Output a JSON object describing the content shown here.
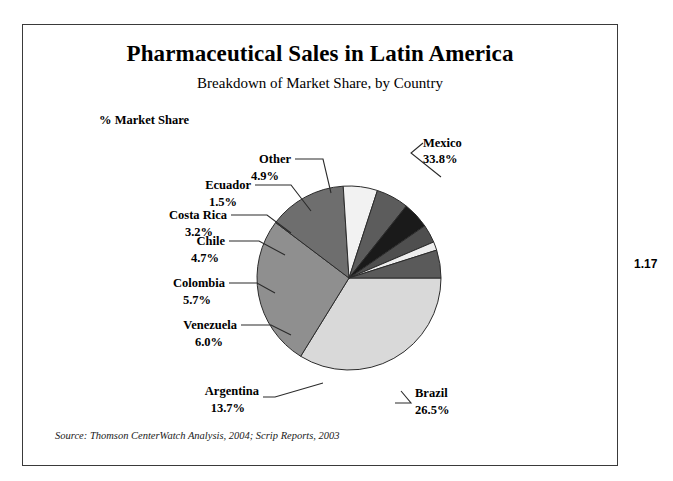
{
  "figure": {
    "number": "1.17",
    "title": "Pharmaceutical Sales in Latin America",
    "subtitle": "Breakdown of Market Share, by Country",
    "axis_note": "% Market Share",
    "source": "Source: Thomson CenterWatch Analysis, 2004; Scrip Reports, 2003"
  },
  "chart_data": {
    "type": "pie",
    "title": "Pharmaceutical Sales in Latin America",
    "subtitle": "Breakdown of Market Share, by Country",
    "ylabel": "% Market Share",
    "xlabel": "",
    "unit": "%",
    "legend": "none",
    "grid": false,
    "start_angle_deg": 0,
    "direction": "clockwise",
    "categories": [
      "Mexico",
      "Brazil",
      "Argentina",
      "Venezuela",
      "Colombia",
      "Chile",
      "Costa Rica",
      "Ecuador",
      "Other"
    ],
    "values": [
      33.8,
      26.5,
      13.7,
      6.0,
      5.7,
      4.7,
      3.2,
      1.5,
      4.9
    ],
    "slices": [
      {
        "label": "Mexico",
        "value": 33.8,
        "display": "33.8%",
        "color": "#d9d9d9"
      },
      {
        "label": "Brazil",
        "value": 26.5,
        "display": "26.5%",
        "color": "#8f8f8f"
      },
      {
        "label": "Argentina",
        "value": 13.7,
        "display": "13.7%",
        "color": "#6e6e6e"
      },
      {
        "label": "Venezuela",
        "value": 6.0,
        "display": "6.0%",
        "color": "#f2f2f2"
      },
      {
        "label": "Colombia",
        "value": 5.7,
        "display": "5.7%",
        "color": "#5c5c5c"
      },
      {
        "label": "Chile",
        "value": 4.7,
        "display": "4.7%",
        "color": "#1a1a1a"
      },
      {
        "label": "Costa Rica",
        "value": 3.2,
        "display": "3.2%",
        "color": "#4f4f4f"
      },
      {
        "label": "Ecuador",
        "value": 1.5,
        "display": "1.5%",
        "color": "#ededed"
      },
      {
        "label": "Other",
        "value": 4.9,
        "display": "4.9%",
        "color": "#5a5a5a"
      }
    ]
  },
  "labels": {
    "mexico_name": "Mexico",
    "mexico_value": "33.8%",
    "brazil_name": "Brazil",
    "brazil_value": "26.5%",
    "argentina_name": "Argentina",
    "argentina_value": "13.7%",
    "venezuela_name": "Venezuela",
    "venezuela_value": "6.0%",
    "colombia_name": "Colombia",
    "colombia_value": "5.7%",
    "chile_name": "Chile",
    "chile_value": "4.7%",
    "costarica_name": "Costa Rica",
    "costarica_value": "3.2%",
    "ecuador_name": "Ecuador",
    "ecuador_value": "1.5%",
    "other_name": "Other",
    "other_value": "4.9%"
  }
}
